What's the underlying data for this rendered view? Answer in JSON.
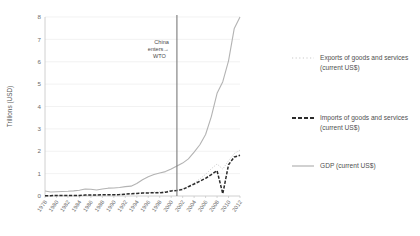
{
  "chart_data": {
    "type": "line",
    "title": "",
    "xlabel": "",
    "ylabel": "Trillions (USD)",
    "ylim": [
      0,
      8
    ],
    "xlim": [
      1978,
      2012
    ],
    "grid": "horizontal",
    "legend_position": "right",
    "y_ticks": [
      "0",
      "1",
      "2",
      "3",
      "4",
      "5",
      "6",
      "7",
      "8"
    ],
    "x_ticks": [
      "1978",
      "1980",
      "1982",
      "1984",
      "1986",
      "1988",
      "1990",
      "1992",
      "1994",
      "1996",
      "1998",
      "2000",
      "2002",
      "2004",
      "2006",
      "2008",
      "2010",
      "2012"
    ],
    "x": [
      1978,
      1979,
      1980,
      1981,
      1982,
      1983,
      1984,
      1985,
      1986,
      1987,
      1988,
      1989,
      1990,
      1991,
      1992,
      1993,
      1994,
      1995,
      1996,
      1997,
      1998,
      1999,
      2000,
      2001,
      2002,
      2003,
      2004,
      2005,
      2006,
      2007,
      2008,
      2009,
      2010,
      2011,
      2012
    ],
    "series": [
      {
        "name": "GDP (current US$)",
        "style": "solid",
        "color": "#b3b3b3",
        "values": [
          0.22,
          0.18,
          0.19,
          0.2,
          0.21,
          0.23,
          0.26,
          0.31,
          0.3,
          0.27,
          0.31,
          0.35,
          0.36,
          0.38,
          0.42,
          0.44,
          0.56,
          0.73,
          0.86,
          0.96,
          1.03,
          1.09,
          1.21,
          1.34,
          1.47,
          1.66,
          1.96,
          2.29,
          2.75,
          3.55,
          4.59,
          5.11,
          6.04,
          7.49,
          8.23
        ],
        "end_value": 7.32
      },
      {
        "name": "Exports of goods and services (current US$)",
        "style": "dotted",
        "color": "#c9c9c9",
        "values": [
          0.011,
          0.014,
          0.018,
          0.022,
          0.022,
          0.022,
          0.026,
          0.027,
          0.031,
          0.039,
          0.047,
          0.052,
          0.062,
          0.072,
          0.085,
          0.075,
          0.121,
          0.149,
          0.151,
          0.182,
          0.184,
          0.195,
          0.253,
          0.266,
          0.326,
          0.438,
          0.577,
          0.762,
          0.969,
          1.218,
          1.43,
          1.202,
          1.578,
          1.898,
          2.049
        ]
      },
      {
        "name": "Imports of goods and services (current US$)",
        "style": "dashed",
        "color": "#2b2b2b",
        "values": [
          0.011,
          0.016,
          0.02,
          0.022,
          0.019,
          0.022,
          0.027,
          0.042,
          0.043,
          0.044,
          0.055,
          0.059,
          0.054,
          0.064,
          0.081,
          0.104,
          0.116,
          0.132,
          0.139,
          0.142,
          0.141,
          0.165,
          0.225,
          0.243,
          0.295,
          0.413,
          0.534,
          0.66,
          0.791,
          0.956,
          1.131,
          0.1005,
          1.396,
          1.743,
          1.818
        ]
      }
    ],
    "annotations": [
      {
        "name": "china-enters-wto",
        "text_line1": "China",
        "text_line2": "enters",
        "text_line3": "WTO",
        "arrow": "→",
        "at_x": 2001,
        "line_color": "#7a7a7a"
      }
    ]
  },
  "legend": {
    "items": [
      {
        "label_line1": "Exports of goods and services",
        "label_line2": "(current US$)",
        "style": "dotted",
        "color": "#c9c9c9"
      },
      {
        "label_line1": "Imports of goods and services",
        "label_line2": "(current US$)",
        "style": "dashed",
        "color": "#2b2b2b"
      },
      {
        "label_line1": "GDP (current US$)",
        "label_line2": "",
        "style": "solid",
        "color": "#b3b3b3"
      }
    ]
  }
}
